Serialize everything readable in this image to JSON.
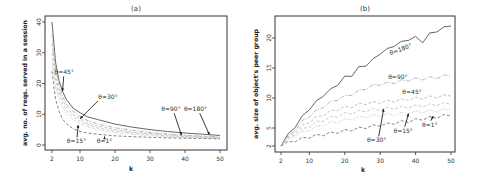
{
  "chart_data": [
    {
      "type": "line",
      "panel": "a",
      "title": "(a)",
      "xlabel": "k",
      "ylabel": "avg. no. of reqs. served in a session",
      "xlim": [
        2,
        50
      ],
      "ylim": [
        0,
        40
      ],
      "xticks": [
        2,
        10,
        20,
        30,
        40,
        50
      ],
      "yticks": [
        0,
        10,
        20,
        30,
        40
      ],
      "grid": false,
      "x": [
        2,
        3,
        4,
        5,
        6,
        8,
        10,
        12,
        15,
        20,
        25,
        30,
        35,
        40,
        45,
        50
      ],
      "series": [
        {
          "name": "θ=180°",
          "style": "solid",
          "color": "#555555",
          "values": [
            40,
            27,
            21,
            17.5,
            15,
            12,
            10.5,
            9.2,
            8.3,
            6.8,
            5.8,
            5.0,
            4.4,
            3.9,
            3.5,
            3.1
          ]
        },
        {
          "name": "θ=90°",
          "style": "dashdot",
          "color": "#aaaaaa",
          "values": [
            36,
            25,
            19.5,
            16,
            13.5,
            11,
            9.3,
            8.0,
            6.9,
            5.6,
            4.8,
            4.1,
            3.6,
            3.2,
            2.9,
            2.6
          ]
        },
        {
          "name": "θ=45°",
          "style": "dashed",
          "color": "#bbbbbb",
          "values": [
            33,
            23,
            18,
            14.8,
            12.5,
            10,
            8.5,
            7.2,
            6.2,
            5.0,
            4.2,
            3.7,
            3.3,
            3.0,
            2.7,
            2.5
          ]
        },
        {
          "name": "θ=30°",
          "style": "dashed",
          "color": "#c4c4c4",
          "values": [
            30,
            21,
            16.5,
            13.5,
            11.5,
            9.2,
            7.7,
            6.6,
            5.6,
            4.5,
            3.9,
            3.4,
            3.0,
            2.7,
            2.5,
            2.3
          ]
        },
        {
          "name": "θ=15°",
          "style": "dotted",
          "color": "#bbbbbb",
          "values": [
            27,
            19,
            15,
            12.2,
            10.3,
            8.2,
            6.9,
            5.9,
            5.0,
            4.0,
            3.4,
            3.0,
            2.7,
            2.5,
            2.3,
            2.1
          ]
        },
        {
          "name": "θ=1°",
          "style": "dashed",
          "color": "#777777",
          "values": [
            24,
            15,
            11,
            8.5,
            7,
            5.3,
            4.4,
            3.9,
            3.5,
            3.0,
            2.7,
            2.5,
            2.3,
            2.2,
            2.1,
            2.0
          ]
        }
      ],
      "annotations": [
        {
          "text": "θ=45°",
          "x": 5.5,
          "y": 23,
          "arrow_to": [
            5,
            17.5
          ]
        },
        {
          "text": "θ=30°",
          "x": 18,
          "y": 15,
          "arrow_to": [
            10,
            8.5
          ]
        },
        {
          "text": "θ=15°",
          "x": 9,
          "y": 0.5,
          "arrow_to": [
            9.5,
            6.5
          ]
        },
        {
          "text": "θ=1°",
          "x": 17,
          "y": 0.5,
          "arrow_to": [
            17,
            2.8
          ]
        },
        {
          "text": "θ=90°",
          "x": 36,
          "y": 11,
          "arrow_to": [
            39,
            3.2
          ]
        },
        {
          "text": "θ=180°",
          "x": 43,
          "y": 11,
          "arrow_to": [
            47,
            3.3
          ]
        }
      ]
    },
    {
      "type": "line",
      "panel": "b",
      "title": "(b)",
      "xlabel": "k",
      "ylabel": "avg. size of object's peer group",
      "xlim": [
        2,
        50
      ],
      "ylim": [
        2,
        22
      ],
      "xticks": [
        2,
        10,
        20,
        30,
        40,
        50
      ],
      "yticks": [
        2,
        5,
        10,
        15,
        20
      ],
      "grid": false,
      "x": [
        2,
        4,
        6,
        8,
        10,
        12,
        14,
        16,
        18,
        20,
        22,
        24,
        26,
        28,
        30,
        32,
        34,
        36,
        38,
        40,
        42,
        44,
        46,
        48,
        50
      ],
      "series": [
        {
          "name": "θ=180°",
          "style": "solid",
          "color": "#555555",
          "values": [
            2,
            3.8,
            5.3,
            6.8,
            8.2,
            9.3,
            10.5,
            11.3,
            12.3,
            13.4,
            13.8,
            15,
            15.5,
            16.3,
            17.5,
            18,
            18.8,
            19.2,
            19.8,
            20,
            19.4,
            20.6,
            21.2,
            21.6,
            22.2
          ]
        },
        {
          "name": "θ=90°",
          "style": "dashdot",
          "color": "#aaaaaa",
          "values": [
            2,
            3.5,
            4.8,
            6,
            7,
            7.8,
            8.6,
            9.2,
            9.8,
            10.2,
            10.6,
            11.1,
            11.6,
            12,
            12.3,
            12.4,
            12.6,
            12.8,
            13,
            13.1,
            13.2,
            13.3,
            13.4,
            13.6,
            13.8
          ]
        },
        {
          "name": "θ=45°",
          "style": "dashed",
          "color": "#bbbbbb",
          "values": [
            2,
            3.3,
            4.4,
            5.3,
            6,
            6.7,
            7.2,
            7.7,
            8.1,
            8.4,
            8.6,
            8.9,
            9.1,
            9.2,
            9.3,
            9.4,
            9.5,
            9.6,
            9.8,
            9.9,
            10,
            10.1,
            10.2,
            10.3,
            10.5
          ]
        },
        {
          "name": "θ=30°",
          "style": "dashed",
          "color": "#c4c4c4",
          "values": [
            2,
            3.1,
            4,
            4.7,
            5.3,
            5.9,
            6.3,
            6.7,
            7,
            7.3,
            7.5,
            7.7,
            7.9,
            8.0,
            8.1,
            8.2,
            8.3,
            8.4,
            8.5,
            8.6,
            8.7,
            8.8,
            8.9,
            9.0,
            9.1
          ]
        },
        {
          "name": "θ=15°",
          "style": "dotted",
          "color": "#bbbbbb",
          "values": [
            2,
            2.9,
            3.6,
            4.2,
            4.7,
            5.1,
            5.5,
            5.8,
            6.1,
            6.3,
            6.5,
            6.7,
            6.9,
            7.0,
            7.1,
            7.2,
            7.3,
            7.4,
            7.5,
            7.6,
            7.7,
            7.8,
            7.9,
            8.0,
            8.1
          ]
        },
        {
          "name": "θ=1°",
          "style": "dashed",
          "color": "#777777",
          "values": [
            2,
            2.5,
            2.9,
            3.2,
            3.5,
            3.7,
            3.9,
            4.1,
            4.3,
            4.5,
            4.7,
            4.9,
            5.1,
            5.3,
            5.5,
            5.6,
            5.8,
            6.0,
            6.1,
            6.3,
            6.5,
            6.7,
            6.8,
            7.0,
            7.2
          ]
        }
      ],
      "annotations": [
        {
          "text": "θ=180°",
          "x": 36,
          "y": 17.8,
          "rotate": -20
        },
        {
          "text": "θ=90°",
          "x": 35,
          "y": 13.2
        },
        {
          "text": "θ=45°",
          "x": 39,
          "y": 10.6
        },
        {
          "text": "θ=30°",
          "x": 29,
          "y": 2.6,
          "arrow_to": [
            31,
            8.2
          ]
        },
        {
          "text": "θ=15°",
          "x": 36.5,
          "y": 4.2,
          "arrow_to": [
            38,
            7.4
          ]
        },
        {
          "text": "θ=1°",
          "x": 44,
          "y": 5.2,
          "arrow_to": [
            45,
            7.0
          ]
        }
      ]
    }
  ],
  "panels": {
    "a": {
      "title": "(a)",
      "xlabel": "k",
      "ylabel": "avg. no. of reqs. served in a session"
    },
    "b": {
      "title": "(b)",
      "xlabel": "k",
      "ylabel": "avg. size of object's peer group"
    }
  }
}
